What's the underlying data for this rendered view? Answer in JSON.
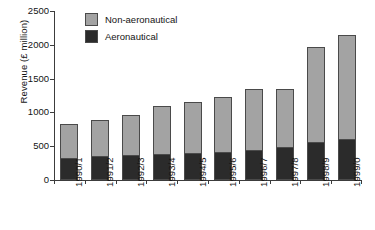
{
  "chart_data": {
    "type": "bar",
    "stacked": true,
    "title": "",
    "xlabel": "",
    "ylabel": "Revenue (£ million)",
    "ylim": [
      0,
      2500
    ],
    "yticks": [
      0,
      500,
      1000,
      1500,
      2000,
      2500
    ],
    "grid": false,
    "legend_position": "top-left-inside",
    "categories": [
      "1990/1",
      "1991/2",
      "1992/3",
      "1993/4",
      "1994/5",
      "1995/6",
      "1996/7",
      "1997/8",
      "1998/9",
      "1999/0"
    ],
    "series": [
      {
        "name": "Aeronautical",
        "color": "#2b2b2b",
        "values": [
          330,
          355,
          365,
          390,
          400,
          410,
          450,
          490,
          560,
          605
        ]
      },
      {
        "name": "Non-aeronautical",
        "color": "#a3a3a3",
        "values": [
          505,
          535,
          590,
          700,
          755,
          820,
          895,
          855,
          1410,
          1535
        ]
      }
    ],
    "totals": [
      835,
      890,
      955,
      1090,
      1155,
      1230,
      1345,
      1345,
      1970,
      2140
    ]
  },
  "legend": {
    "items": [
      {
        "label": "Non-aeronautical",
        "color": "#a3a3a3"
      },
      {
        "label": "Aeronautical",
        "color": "#2b2b2b"
      }
    ]
  },
  "axis": {
    "y_title": "Revenue (£ million)",
    "y_tick_labels": [
      "2500",
      "2000",
      "1500",
      "1000",
      "500",
      "0"
    ]
  }
}
